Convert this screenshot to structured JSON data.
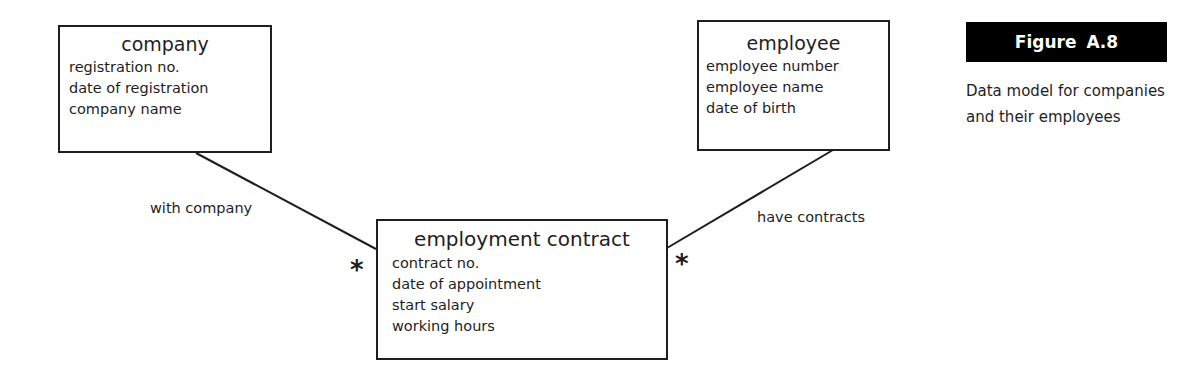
{
  "figure": {
    "label": "Figure  A.8",
    "caption": "Data model for companies and their employees"
  },
  "entities": {
    "company": {
      "title": "company",
      "attributes": [
        "registration no.",
        "date of registration",
        "company name"
      ]
    },
    "employee": {
      "title": "employee",
      "attributes": [
        "employee number",
        "employee name",
        "date of birth"
      ]
    },
    "contract": {
      "title": "employment contract",
      "attributes": [
        "contract no.",
        "date of appointment",
        "start salary",
        "working hours"
      ]
    }
  },
  "relationships": {
    "with_company": {
      "label": "with company",
      "multiplicity": "*"
    },
    "have_contracts": {
      "label": "have contracts",
      "multiplicity": "*"
    }
  },
  "colors": {
    "line": "#1e1e1e",
    "label_bg": "#000000",
    "label_text": "#ffffff"
  }
}
